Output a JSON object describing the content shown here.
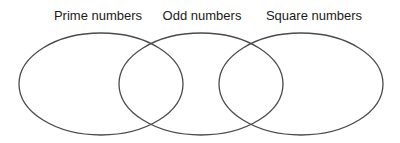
{
  "diagram": {
    "type": "venn",
    "sets": [
      {
        "id": "prime",
        "label": "Prime numbers",
        "label_center_x": 98,
        "ellipse": {
          "cx": 101,
          "cy": 84,
          "rx": 82,
          "ry": 51
        }
      },
      {
        "id": "odd",
        "label": "Odd numbers",
        "label_center_x": 202,
        "ellipse": {
          "cx": 201,
          "cy": 84,
          "rx": 82,
          "ry": 51
        }
      },
      {
        "id": "square",
        "label": "Square numbers",
        "label_center_x": 314,
        "ellipse": {
          "cx": 301,
          "cy": 84,
          "rx": 82,
          "ry": 51
        }
      }
    ],
    "stroke_color": "#4a4a4a",
    "fill_color": "none",
    "background_color": "#ffffff"
  }
}
